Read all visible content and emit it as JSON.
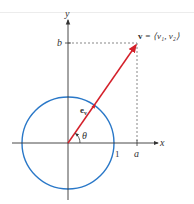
{
  "diagram": {
    "axes": {
      "x_label": "x",
      "y_label": "y"
    },
    "vector": {
      "label": "v = ⟨v₁, v₂⟩",
      "label_bold": "v",
      "label_rest": " = ⟨v₁, v₂⟩",
      "color": "#d4202a"
    },
    "unit_vector": {
      "label_base": "e",
      "label_sub": "v"
    },
    "angle_label": "θ",
    "ticks": {
      "one": "1",
      "a": "a",
      "b": "b"
    },
    "circle": {
      "color": "#2a78c8",
      "description": "unit circle"
    },
    "colors": {
      "axis": "#333333",
      "dashed": "#555555"
    }
  }
}
